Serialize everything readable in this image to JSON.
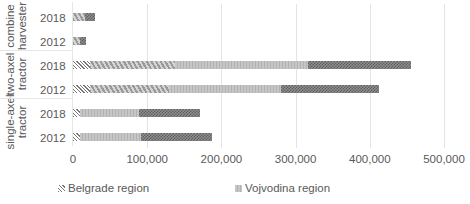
{
  "chart_data": {
    "type": "bar",
    "orientation": "horizontal",
    "stacked": true,
    "title": "",
    "xlabel": "",
    "ylabel": "",
    "xlim": [
      0,
      500000
    ],
    "x_ticks": [
      "0",
      "100,000",
      "200,000",
      "300,000",
      "400,000",
      "500,000"
    ],
    "grid": true,
    "legend_position": "bottom",
    "legend": [
      "Belgrade region",
      "Vojvodina region"
    ],
    "category_groups": [
      {
        "label": "combine harvester",
        "rows": [
          "2018",
          "2012"
        ]
      },
      {
        "label": "two-axel tractor",
        "rows": [
          "2018",
          "2012"
        ]
      },
      {
        "label": "single-axel tractor",
        "rows": [
          "2018",
          "2012"
        ]
      }
    ],
    "categories": [
      "combine harvester 2018",
      "combine harvester 2012",
      "two-axel tractor 2018",
      "two-axel tractor 2012",
      "single-axel tractor 2018",
      "single-axel tractor 2012"
    ],
    "series": [
      {
        "name": "Belgrade region",
        "pattern": "p1",
        "values": [
          0,
          0,
          23000,
          23000,
          9000,
          9000
        ]
      },
      {
        "name": "Vojvodina region",
        "pattern": "p2",
        "values": [
          16000,
          9000,
          115000,
          107000,
          0,
          0
        ]
      },
      {
        "name": "",
        "pattern": "p3",
        "values": [
          0,
          0,
          179000,
          150000,
          80000,
          82000
        ]
      },
      {
        "name": "",
        "pattern": "p4",
        "values": [
          14000,
          8000,
          139000,
          132000,
          82000,
          96000
        ]
      }
    ]
  },
  "labels": {
    "groups": [
      "combine\nharvester",
      "two-axel\ntractor",
      "single-axel\ntractor"
    ],
    "years": [
      "2018",
      "2012",
      "2018",
      "2012",
      "2018",
      "2012"
    ]
  },
  "axis": {
    "ticks": [
      {
        "label": "0",
        "value": 0
      },
      {
        "label": "100,000",
        "value": 100000
      },
      {
        "label": "200,000",
        "value": 200000
      },
      {
        "label": "300,000",
        "value": 300000
      },
      {
        "label": "400,000",
        "value": 400000
      },
      {
        "label": "500,000",
        "value": 500000
      }
    ]
  },
  "legend": {
    "items": [
      {
        "label": "Belgrade region",
        "pattern": "p1"
      },
      {
        "label": "Vojvodina region",
        "pattern": "p2"
      }
    ]
  }
}
